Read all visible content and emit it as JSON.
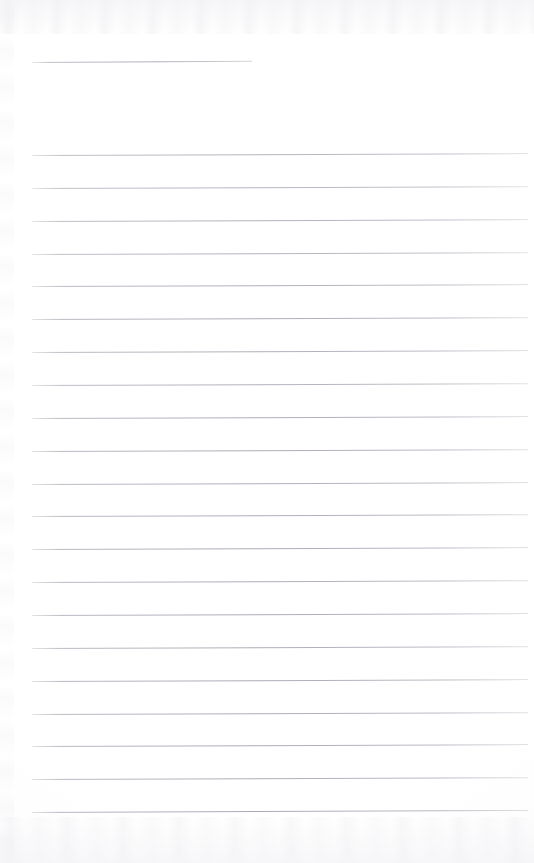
{
  "document": {
    "type": "scanned-lined-paper",
    "title": "Blank ruled notebook page (scan)",
    "page_width": 534,
    "page_height": 863,
    "background_color": "#fdfdfd",
    "rule_color": "#9ea1ab",
    "text_content": "",
    "is_blank": true,
    "total_rules": 22
  },
  "layout": {
    "left_margin_x": 32,
    "right_margin_x": 528,
    "first_rule_y": 62,
    "body_first_rule_y": 155,
    "last_rule_y": 812,
    "rule_spacing": 32.85,
    "rule_thickness": 1
  },
  "rules": [
    {
      "id": "rule-header",
      "y": 62,
      "x1": 32,
      "x2": 252,
      "skew_deg": -0.3,
      "opacity": 0.85,
      "short": true
    },
    {
      "id": "rule-01",
      "y": 155.0,
      "x1": 32,
      "x2": 528,
      "skew_deg": -0.22,
      "opacity": 0.8,
      "short": false
    },
    {
      "id": "rule-02",
      "y": 187.9,
      "x1": 32,
      "x2": 528,
      "skew_deg": -0.2,
      "opacity": 0.78,
      "short": false
    },
    {
      "id": "rule-03",
      "y": 220.7,
      "x1": 32,
      "x2": 528,
      "skew_deg": -0.22,
      "opacity": 0.82,
      "short": false
    },
    {
      "id": "rule-04",
      "y": 253.6,
      "x1": 32,
      "x2": 528,
      "skew_deg": -0.2,
      "opacity": 0.8,
      "short": false
    },
    {
      "id": "rule-05",
      "y": 286.4,
      "x1": 32,
      "x2": 528,
      "skew_deg": -0.22,
      "opacity": 0.84,
      "short": false
    },
    {
      "id": "rule-06",
      "y": 319.3,
      "x1": 32,
      "x2": 528,
      "skew_deg": -0.21,
      "opacity": 0.86,
      "short": false
    },
    {
      "id": "rule-07",
      "y": 352.1,
      "x1": 32,
      "x2": 528,
      "skew_deg": -0.22,
      "opacity": 0.84,
      "short": false
    },
    {
      "id": "rule-08",
      "y": 385.0,
      "x1": 32,
      "x2": 528,
      "skew_deg": -0.2,
      "opacity": 0.82,
      "short": false
    },
    {
      "id": "rule-09",
      "y": 417.8,
      "x1": 32,
      "x2": 528,
      "skew_deg": -0.22,
      "opacity": 0.86,
      "short": false
    },
    {
      "id": "rule-10",
      "y": 450.7,
      "x1": 32,
      "x2": 528,
      "skew_deg": -0.21,
      "opacity": 0.88,
      "short": false
    },
    {
      "id": "rule-11",
      "y": 483.5,
      "x1": 32,
      "x2": 528,
      "skew_deg": -0.22,
      "opacity": 0.84,
      "short": false
    },
    {
      "id": "rule-12",
      "y": 516.4,
      "x1": 32,
      "x2": 528,
      "skew_deg": -0.2,
      "opacity": 0.86,
      "short": false
    },
    {
      "id": "rule-13",
      "y": 549.2,
      "x1": 32,
      "x2": 528,
      "skew_deg": -0.22,
      "opacity": 0.88,
      "short": false
    },
    {
      "id": "rule-14",
      "y": 582.1,
      "x1": 32,
      "x2": 528,
      "skew_deg": -0.21,
      "opacity": 0.86,
      "short": false
    },
    {
      "id": "rule-15",
      "y": 614.9,
      "x1": 32,
      "x2": 528,
      "skew_deg": -0.22,
      "opacity": 0.88,
      "short": false
    },
    {
      "id": "rule-16",
      "y": 647.8,
      "x1": 32,
      "x2": 528,
      "skew_deg": -0.2,
      "opacity": 0.86,
      "short": false
    },
    {
      "id": "rule-17",
      "y": 680.6,
      "x1": 32,
      "x2": 528,
      "skew_deg": -0.22,
      "opacity": 0.88,
      "short": false
    },
    {
      "id": "rule-18",
      "y": 713.5,
      "x1": 32,
      "x2": 528,
      "skew_deg": -0.21,
      "opacity": 0.86,
      "short": false
    },
    {
      "id": "rule-19",
      "y": 746.3,
      "x1": 32,
      "x2": 528,
      "skew_deg": -0.22,
      "opacity": 0.88,
      "short": false
    },
    {
      "id": "rule-20",
      "y": 779.2,
      "x1": 32,
      "x2": 528,
      "skew_deg": -0.21,
      "opacity": 0.86,
      "short": false
    },
    {
      "id": "rule-21",
      "y": 812.0,
      "x1": 32,
      "x2": 528,
      "skew_deg": -0.24,
      "opacity": 0.9,
      "short": false
    }
  ]
}
